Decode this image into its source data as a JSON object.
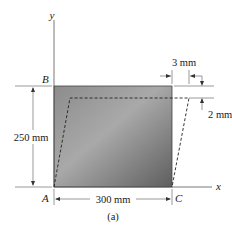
{
  "figure": {
    "caption": "(a)",
    "axes": {
      "x_label": "x",
      "y_label": "y"
    },
    "points": {
      "A": "A",
      "B": "B",
      "C": "C"
    },
    "dimensions": {
      "height": "250 mm",
      "width": "300 mm",
      "horizontal_displacement": "3 mm",
      "vertical_displacement": "2 mm"
    },
    "colors": {
      "plate_dark": "#5a5a5a",
      "plate_light": "#a8a8a8",
      "line": "#333333"
    }
  }
}
